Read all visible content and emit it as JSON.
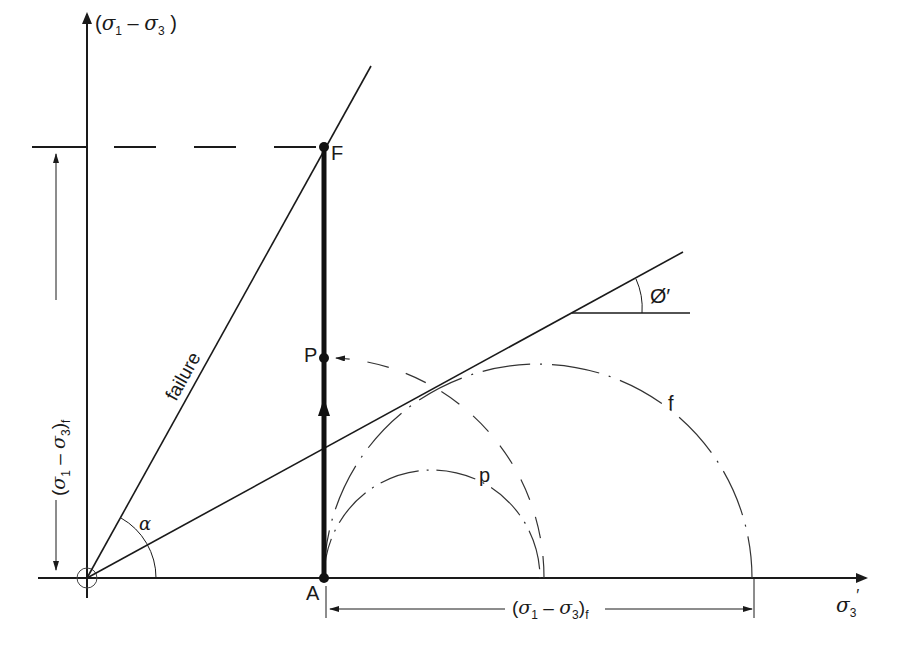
{
  "diagram": {
    "type": "stress-path-mohr-circle",
    "axes": {
      "y_label_open": "(",
      "y_label_sym1": "σ",
      "y_label_sub1": "1",
      "y_label_minus": " – ",
      "y_label_sym2": "σ",
      "y_label_sub2": "3",
      "y_label_close": " )",
      "x_label_sym": "σ",
      "x_label_sub": "3",
      "x_label_prime": "′"
    },
    "lines": {
      "failure_label": "failure",
      "alpha_label": "α",
      "phi_label": "Ø′"
    },
    "points": {
      "F": "F",
      "P": "P",
      "A": "A"
    },
    "circles": {
      "p_label": "p",
      "f_label": "f"
    },
    "dimensions": {
      "vertical": {
        "open": "(",
        "sym1": "σ",
        "sub1": "1",
        "minus": " – ",
        "sym2": "σ",
        "sub2": "3",
        "close": ")",
        "subscript": "f"
      },
      "horizontal": {
        "open": "(",
        "sym1": "σ",
        "sub1": "1",
        "minus": " – ",
        "sym2": "σ",
        "sub2": "3",
        "close": ")",
        "subscript": "f"
      }
    },
    "colors": {
      "ink": "#1a1a1a",
      "background": "#ffffff"
    }
  }
}
